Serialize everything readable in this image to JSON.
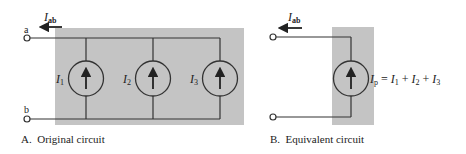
{
  "figure_a": {
    "caption": "A.  Original circuit",
    "terminal_top_label": "a",
    "terminal_bottom_label": "b",
    "current_label_main": "I",
    "current_label_sub": "ab",
    "sources": [
      {
        "label_main": "I",
        "label_sub": "1",
        "direction": "up"
      },
      {
        "label_main": "I",
        "label_sub": "2",
        "direction": "up"
      },
      {
        "label_main": "I",
        "label_sub": "3",
        "direction": "up"
      }
    ]
  },
  "figure_b": {
    "caption": "B.  Equivalent circuit",
    "current_label_main": "I",
    "current_label_sub": "ab",
    "source": {
      "direction": "up"
    },
    "equation": {
      "lhs_main": "I",
      "lhs_sub": "p",
      "eq": " = ",
      "t1_main": "I",
      "t1_sub": "1",
      "plus1": " + ",
      "t2_main": "I",
      "t2_sub": "2",
      "plus2": " + ",
      "t3_main": "I",
      "t3_sub": "3"
    }
  }
}
